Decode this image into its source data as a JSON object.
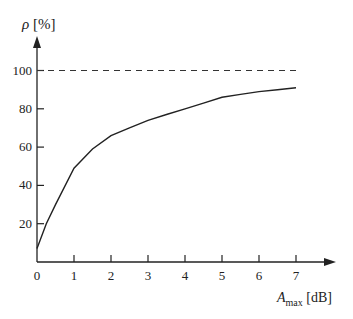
{
  "chart_data": {
    "type": "line",
    "title": "",
    "xlabel": "A_max [dB]",
    "ylabel": "ρ [%]",
    "x_ticks": [
      "0",
      "1",
      "2",
      "3",
      "4",
      "5",
      "6",
      "7"
    ],
    "y_ticks": [
      "20",
      "40",
      "60",
      "80",
      "100"
    ],
    "xlim": [
      0,
      8
    ],
    "ylim": [
      0,
      110
    ],
    "grid": false,
    "series": [
      {
        "name": "ρ",
        "style": "solid",
        "x": [
          0,
          0.25,
          0.5,
          1,
          1.5,
          2,
          2.5,
          3,
          3.5,
          4,
          4.5,
          5,
          5.5,
          6,
          6.5,
          7
        ],
        "y": [
          7,
          20,
          30,
          49,
          59,
          66,
          70,
          74,
          77,
          80,
          83,
          86,
          87.5,
          89,
          90,
          91
        ]
      },
      {
        "name": "100% asymptote",
        "style": "dashed",
        "x": [
          0,
          7
        ],
        "y": [
          100,
          100
        ]
      }
    ]
  },
  "labels": {
    "y_axis_symbol": "ρ",
    "y_axis_unit": "[%]",
    "x_axis_symbol": "A",
    "x_axis_subscript": "max",
    "x_axis_unit": "[dB]"
  }
}
